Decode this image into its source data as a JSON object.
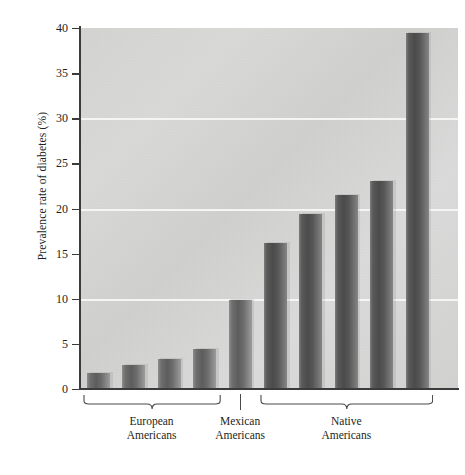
{
  "chart_data": {
    "type": "bar",
    "title": "",
    "xlabel": "",
    "ylabel": "Prevalence rate of diabetes (%)",
    "ylim": [
      0,
      40
    ],
    "yticks": [
      0,
      5,
      10,
      15,
      20,
      25,
      30,
      35,
      40
    ],
    "ytick_labels": [
      "0",
      "5",
      "10",
      "15",
      "20",
      "25",
      "30",
      "35",
      "40"
    ],
    "gridlines": [
      10,
      20,
      30
    ],
    "grid": true,
    "legend": "none",
    "categories": [
      "1",
      "2",
      "3",
      "4",
      "5",
      "6",
      "7",
      "8",
      "9"
    ],
    "values": [
      1.8,
      2.7,
      3.3,
      4.4,
      9.9,
      16.2,
      19.4,
      21.5,
      23.1
    ],
    "extra_values": [
      39.4
    ],
    "all_values": [
      1.8,
      2.7,
      3.3,
      4.4,
      9.9,
      16.2,
      19.4,
      21.5,
      23.1,
      39.4
    ],
    "bars": [
      {
        "index": 1,
        "value": 1.8,
        "group": "European Americans"
      },
      {
        "index": 2,
        "value": 2.7,
        "group": "European Americans"
      },
      {
        "index": 3,
        "value": 3.3,
        "group": "European Americans"
      },
      {
        "index": 4,
        "value": 4.4,
        "group": "European Americans"
      },
      {
        "index": 5,
        "value": 9.9,
        "group": "Mexican Americans"
      },
      {
        "index": 6,
        "value": 16.2,
        "group": "Native Americans"
      },
      {
        "index": 7,
        "value": 19.4,
        "group": "Native Americans"
      },
      {
        "index": 8,
        "value": 21.5,
        "group": "Native Americans"
      },
      {
        "index": 9,
        "value": 23.1,
        "group": "Native Americans"
      },
      {
        "index": 10,
        "value": 39.4,
        "group": "Native Americans"
      }
    ],
    "groups": [
      {
        "label_line1": "European",
        "label_line2": "Americans",
        "bar_indices": [
          1,
          2,
          3,
          4
        ]
      },
      {
        "label_line1": "Mexican",
        "label_line2": "Americans",
        "bar_indices": [
          5
        ]
      },
      {
        "label_line1": "Native",
        "label_line2": "Americans",
        "bar_indices": [
          6,
          7,
          8,
          9,
          10
        ]
      }
    ],
    "colors": {
      "plot_background": "#d7d7d5",
      "bar_fill": "#5d5d5d",
      "gridline": "#f7f7f5",
      "axis": "#3b3b3b",
      "text": "#231f20"
    }
  },
  "axis": {
    "y_title": "Prevalence rate of diabetes (%)"
  }
}
